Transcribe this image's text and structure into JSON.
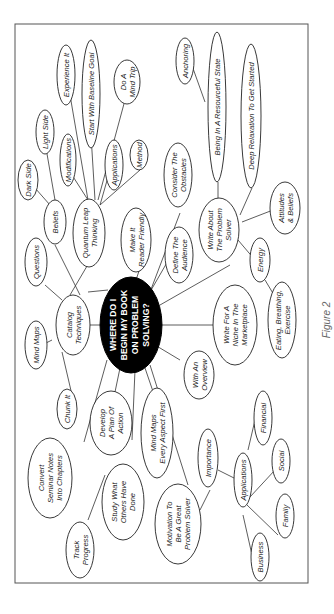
{
  "figure_caption": "Figure 2",
  "center": {
    "lines": [
      "WHERE DO I",
      "BEGIN MY BOOK",
      "ON PROBLEM",
      "SOLVING?"
    ]
  },
  "nodes": {
    "catalog": [
      "Catalog",
      "Techniques"
    ],
    "questions": [
      "Questions"
    ],
    "mindmaps": [
      "Mind Maps"
    ],
    "chunk": [
      "Chunk It"
    ],
    "beliefs": [
      "Beliefs"
    ],
    "darkside": [
      "Dark Side"
    ],
    "lightside": [
      "Light Side"
    ],
    "quantum": [
      "Quantum Leap",
      "Thinking"
    ],
    "modifications": [
      "Modifications"
    ],
    "experience": [
      "Experience It"
    ],
    "baseline": [
      "Start With Baseline Goal"
    ],
    "mindtrip": [
      "Do A",
      "Mind Trip"
    ],
    "applications_q": [
      "Applications"
    ],
    "method": [
      "Method"
    ],
    "reader": [
      "Make It",
      "Reader Friendly"
    ],
    "obstacles": [
      "Consider The",
      "Obstacles"
    ],
    "audience": [
      "Define The",
      "Audience"
    ],
    "anchoring": [
      "Anchoring"
    ],
    "resourceful": [
      "Being In A Resourceful State"
    ],
    "relaxation": [
      "Deep Relaxation To Get Started"
    ],
    "solver": [
      "Write About",
      "The Problem",
      "Solver"
    ],
    "attitudes": [
      "Attitudes",
      "& Beliefs"
    ],
    "energy": [
      "Energy"
    ],
    "eating": [
      "Eating, Breathing,",
      "Exercise"
    ],
    "niche": [
      "Write For A",
      "Niche In The",
      "Marketplace"
    ],
    "overview": [
      "With An",
      "Overview"
    ],
    "develop": [
      "Develop",
      "A Plan Of",
      "Action"
    ],
    "convert": [
      "Convert",
      "Seminar Notes",
      "Into Chapters"
    ],
    "track": [
      "Track",
      "Progress"
    ],
    "study": [
      "Study What",
      "Others Have",
      "Done"
    ],
    "mmfirst": [
      "Mind Maps",
      "Every Aspect First"
    ],
    "motivation": [
      "Motivation To",
      "Be A Great",
      "Problem Solver"
    ],
    "importance": [
      "Importance"
    ],
    "applications_m": [
      "Applications"
    ],
    "financial": [
      "Financial"
    ],
    "social": [
      "Social"
    ],
    "family": [
      "Family"
    ],
    "business": [
      "Business"
    ]
  }
}
